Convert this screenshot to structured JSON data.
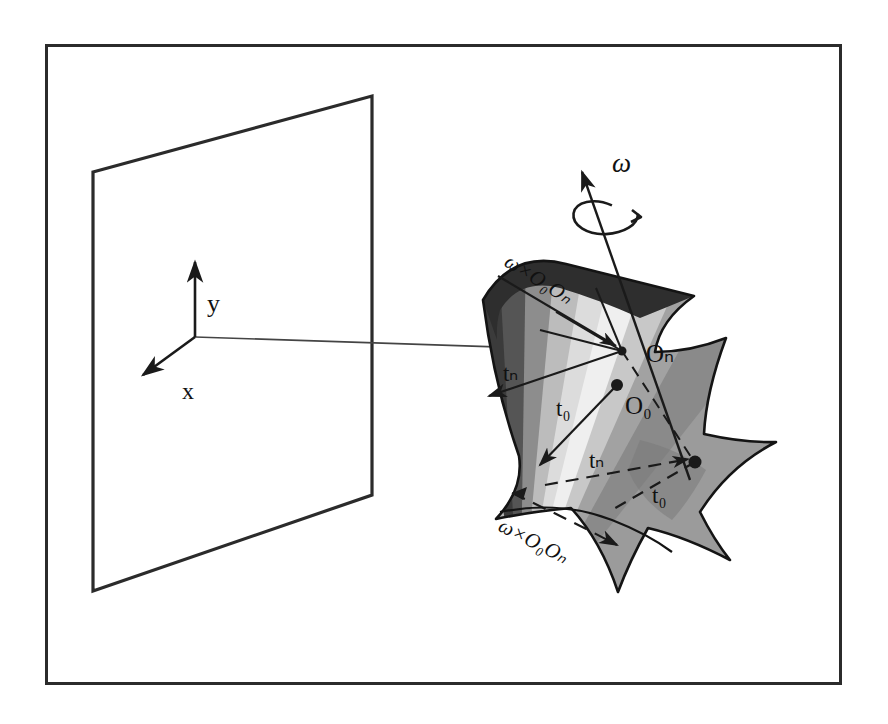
{
  "figure": {
    "domain": "Diagram",
    "background_color": "#ffffff",
    "border": {
      "name": "figure-border",
      "color": "#2b2b2b",
      "x": 45,
      "y": 44,
      "width": 797,
      "height": 641,
      "stroke_width": 3
    },
    "caption": ""
  },
  "plane": {
    "name": "image-plane",
    "stroke_color": "#2b2b2b",
    "fill_color": "#ffffff",
    "points": "93,172 372,96 372,495 93,591"
  },
  "axes": {
    "origin": {
      "x": 195,
      "y": 337
    },
    "y_axis": {
      "label": "y",
      "label_x": 207,
      "label_y": 306,
      "tip_x": 195,
      "tip_y": 258
    },
    "x_axis": {
      "label": "x",
      "label_x": 187,
      "label_y": 393,
      "tip_x": 139,
      "tip_y": 377
    },
    "z_axis": {
      "label": "",
      "tip_x": 622,
      "tip_y": 351
    },
    "stroke_color": "#2b2b2b"
  },
  "surface": {
    "name": "curved-surface-patch",
    "outline_color": "#1a1a1a",
    "band_colors": [
      "#3b3b3b",
      "#5a5a5a",
      "#8f8f8f",
      "#b9b9b9",
      "#d8d8d8",
      "#efefef",
      "#c9c9c9",
      "#a0a0a0",
      "#888888",
      "#9a9a9a"
    ]
  },
  "labels": {
    "omega": {
      "text": "ω",
      "name": "omega-label",
      "x": 617,
      "y": 163
    },
    "omega_cross_upper": {
      "text": "ω×O₀Oₙ",
      "name": "omega-cross-upper-label",
      "x": 503,
      "y": 265,
      "rotation": 32
    },
    "omega_cross_lower": {
      "text": "ω×O₀Oₙ",
      "name": "omega-cross-lower-label",
      "x": 497,
      "y": 530,
      "rotation": 27
    },
    "O_n": {
      "text": "Oₙ",
      "name": "point-On-label",
      "x": 648,
      "y": 357
    },
    "O_0": {
      "text": "O₀",
      "name": "point-O0-label",
      "x": 628,
      "y": 409
    },
    "t_n_left": {
      "text": "tₙ",
      "name": "tn-left-label",
      "x": 509,
      "y": 377
    },
    "t_0_left": {
      "text": "t₀",
      "name": "t0-left-label",
      "x": 558,
      "y": 410
    },
    "t_n_mid": {
      "text": "tₙ",
      "name": "tn-mid-label",
      "x": 595,
      "y": 462
    },
    "t_0_right": {
      "text": "t₀",
      "name": "t0-right-label",
      "x": 657,
      "y": 497
    }
  },
  "points": [
    {
      "name": "point-On",
      "x": 622,
      "y": 351
    },
    {
      "name": "point-O0",
      "x": 617,
      "y": 385
    },
    {
      "name": "point-surface-right",
      "x": 695,
      "y": 462
    }
  ],
  "colors": {
    "ink": "#1a1a1a",
    "border": "#2b2b2b",
    "background": "#ffffff"
  }
}
